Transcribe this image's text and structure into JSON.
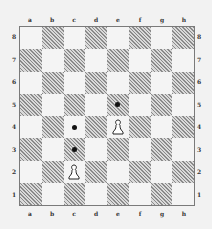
{
  "diagram": {
    "type": "chessboard",
    "files": [
      "a",
      "b",
      "c",
      "d",
      "e",
      "f",
      "g",
      "h"
    ],
    "ranks": [
      "8",
      "7",
      "6",
      "5",
      "4",
      "3",
      "2",
      "1"
    ],
    "colors": {
      "light_square": "#f4f4f4",
      "dark_square_hatch": "#8a8a8a",
      "border": "#7a7a7a",
      "marker": "#111111"
    },
    "pieces": [
      {
        "square": "e4",
        "piece": "pawn",
        "color": "white"
      },
      {
        "square": "c2",
        "piece": "pawn",
        "color": "white"
      }
    ],
    "markers": [
      {
        "square": "e5",
        "type": "dot"
      },
      {
        "square": "c4",
        "type": "dot"
      },
      {
        "square": "c3",
        "type": "dot"
      }
    ]
  }
}
